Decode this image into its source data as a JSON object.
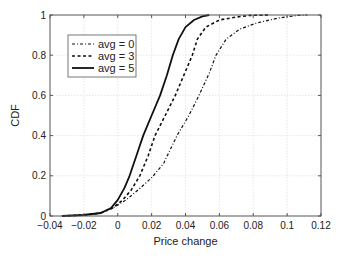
{
  "chart_data": {
    "type": "line",
    "title": "",
    "xlabel": "Price change",
    "ylabel": "CDF",
    "xlim": [
      -0.04,
      0.12
    ],
    "ylim": [
      0,
      1
    ],
    "xticks": [
      -0.04,
      -0.02,
      0,
      0.02,
      0.04,
      0.06,
      0.08,
      0.1,
      0.12
    ],
    "xtick_labels": [
      "−0.04",
      "−0.02",
      "0",
      "0.02",
      "0.04",
      "0.06",
      "0.08",
      "0.1",
      "0.12"
    ],
    "yticks": [
      0,
      0.2,
      0.4,
      0.6,
      0.8,
      1
    ],
    "ytick_labels": [
      "0",
      "0.2",
      "0.4",
      "0.6",
      "0.8",
      "1"
    ],
    "grid": true,
    "legend_position": "upper-left",
    "series": [
      {
        "name": "avg = 0",
        "style": "dash-dot",
        "x": [
          -0.033,
          -0.02,
          -0.01,
          -0.003,
          0.005,
          0.012,
          0.02,
          0.027,
          0.035,
          0.042,
          0.048,
          0.054,
          0.058,
          0.064,
          0.072,
          0.082,
          0.095,
          0.106,
          0.112
        ],
        "y": [
          0,
          0.005,
          0.015,
          0.04,
          0.08,
          0.13,
          0.19,
          0.26,
          0.4,
          0.5,
          0.6,
          0.71,
          0.8,
          0.88,
          0.93,
          0.96,
          0.985,
          0.998,
          1
        ]
      },
      {
        "name": "avg = 3",
        "style": "dashed",
        "x": [
          -0.033,
          -0.02,
          -0.01,
          -0.003,
          0.003,
          0.008,
          0.013,
          0.018,
          0.022,
          0.028,
          0.034,
          0.039,
          0.044,
          0.047,
          0.052,
          0.06,
          0.07,
          0.078,
          0.09
        ],
        "y": [
          0,
          0.005,
          0.015,
          0.04,
          0.08,
          0.13,
          0.2,
          0.3,
          0.4,
          0.5,
          0.6,
          0.7,
          0.8,
          0.88,
          0.94,
          0.975,
          0.99,
          0.998,
          1
        ]
      },
      {
        "name": "avg = 5",
        "style": "solid",
        "x": [
          -0.033,
          -0.02,
          -0.01,
          -0.004,
          0.0,
          0.004,
          0.007,
          0.011,
          0.015,
          0.02,
          0.025,
          0.029,
          0.0325,
          0.036,
          0.04,
          0.045,
          0.05,
          0.054
        ],
        "y": [
          0,
          0.005,
          0.015,
          0.04,
          0.08,
          0.14,
          0.2,
          0.3,
          0.4,
          0.5,
          0.6,
          0.7,
          0.8,
          0.88,
          0.94,
          0.975,
          0.993,
          1
        ]
      }
    ]
  }
}
